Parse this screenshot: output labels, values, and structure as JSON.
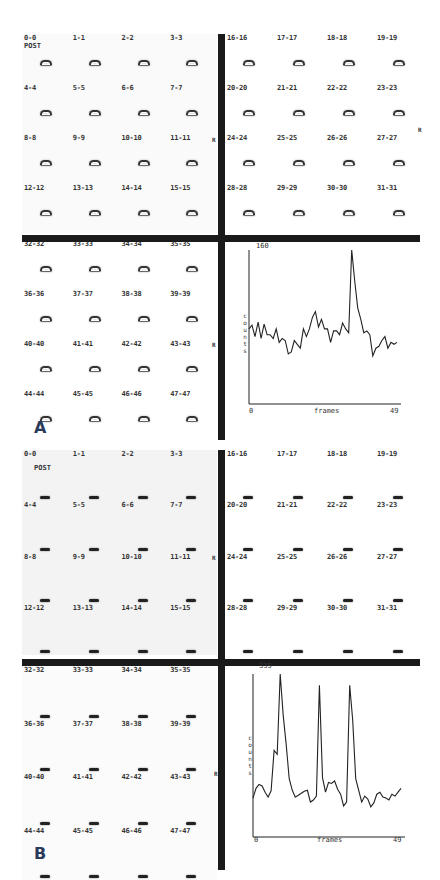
{
  "figure": {
    "panels": [
      {
        "id": "A",
        "letter": "A",
        "post_label": "POST",
        "quadrants": [
          {
            "labels": [
              "0-0",
              "1-1",
              "2-2",
              "3-3",
              "4-4",
              "5-5",
              "6-6",
              "7-7",
              "8-8",
              "9-9",
              "10-10",
              "11-11",
              "12-12",
              "13-13",
              "14-14",
              "15-15"
            ]
          },
          {
            "labels": [
              "16-16",
              "17-17",
              "18-18",
              "19-19",
              "20-20",
              "21-21",
              "22-22",
              "23-23",
              "24-24",
              "25-25",
              "26-26",
              "27-27",
              "28-28",
              "29-29",
              "30-30",
              "31-31"
            ]
          },
          {
            "labels": [
              "32-32",
              "33-33",
              "34-34",
              "35-35",
              "36-36",
              "37-37",
              "38-38",
              "39-39",
              "40-40",
              "41-41",
              "42-42",
              "43-43",
              "44-44",
              "45-45",
              "46-46",
              "47-47"
            ]
          }
        ],
        "markers": {
          "r1": "R",
          "l1": "L",
          "r2": "R",
          "r3": "R",
          "l2": "L",
          "l3": "L"
        }
      },
      {
        "id": "B",
        "letter": "B",
        "post_label": "POST",
        "quadrants": [
          {
            "labels": [
              "0-0",
              "1-1",
              "2-2",
              "3-3",
              "4-4",
              "5-5",
              "6-6",
              "7-7",
              "8-8",
              "9-9",
              "10-10",
              "11-11",
              "12-12",
              "13-13",
              "14-14",
              "15-15"
            ]
          },
          {
            "labels": [
              "16-16",
              "17-17",
              "18-18",
              "19-19",
              "20-20",
              "21-21",
              "22-22",
              "23-23",
              "24-24",
              "25-25",
              "26-26",
              "27-27",
              "28-28",
              "29-29",
              "30-30",
              "31-31"
            ]
          },
          {
            "labels": [
              "32-32",
              "33-33",
              "34-34",
              "35-35",
              "36-36",
              "37-37",
              "38-38",
              "39-39",
              "40-40",
              "41-41",
              "42-42",
              "43-43",
              "44-44",
              "45-45",
              "46-46",
              "47-47"
            ]
          }
        ],
        "markers": {
          "r1": "R",
          "l1": "L",
          "r2": "R",
          "r3": "R",
          "l2": "L",
          "l3": "L"
        }
      }
    ]
  },
  "chart_data": [
    {
      "type": "line",
      "panel": "A",
      "title": "",
      "xlabel": "frames",
      "ylabel": "counts",
      "y_top_label": "160",
      "x_tick_labels": [
        "0",
        "49"
      ],
      "xlim": [
        0,
        49
      ],
      "ylim": [
        0,
        160
      ],
      "grid": false,
      "values_note": "approximate, estimated from the plotted curve",
      "x": [
        0,
        1,
        2,
        3,
        4,
        5,
        6,
        7,
        8,
        9,
        10,
        11,
        12,
        13,
        14,
        15,
        16,
        17,
        18,
        19,
        20,
        21,
        22,
        23,
        24,
        25,
        26,
        27,
        28,
        29,
        30,
        31,
        32,
        33,
        34,
        35,
        36,
        37,
        38,
        39,
        40,
        41,
        42,
        43,
        44,
        45,
        46,
        47,
        48,
        49
      ],
      "values": [
        78,
        82,
        70,
        85,
        68,
        83,
        72,
        72,
        68,
        78,
        64,
        68,
        66,
        52,
        54,
        66,
        62,
        58,
        78,
        70,
        78,
        90,
        96,
        80,
        88,
        78,
        78,
        64,
        76,
        76,
        72,
        84,
        78,
        74,
        160,
        128,
        100,
        88,
        74,
        76,
        72,
        50,
        58,
        60,
        66,
        70,
        58,
        64,
        62,
        64
      ]
    },
    {
      "type": "line",
      "panel": "B",
      "title": "",
      "xlabel": "frames",
      "ylabel": "counts",
      "y_top_label": "335",
      "x_tick_labels": [
        "0",
        "49"
      ],
      "xlim": [
        0,
        49
      ],
      "ylim": [
        0,
        335
      ],
      "grid": false,
      "values_note": "approximate, estimated from the plotted curve",
      "x": [
        0,
        1,
        2,
        3,
        4,
        5,
        6,
        7,
        8,
        9,
        10,
        11,
        12,
        13,
        14,
        15,
        16,
        17,
        18,
        19,
        20,
        21,
        22,
        23,
        24,
        25,
        26,
        27,
        28,
        29,
        30,
        31,
        32,
        33,
        34,
        35,
        36,
        37,
        38,
        39,
        40,
        41,
        42,
        43,
        44,
        45,
        46,
        47,
        48,
        49
      ],
      "values": [
        80,
        100,
        108,
        105,
        92,
        82,
        95,
        178,
        170,
        335,
        250,
        190,
        120,
        96,
        82,
        86,
        90,
        94,
        96,
        72,
        76,
        84,
        312,
        122,
        92,
        112,
        110,
        115,
        98,
        88,
        64,
        72,
        312,
        240,
        120,
        96,
        72,
        84,
        78,
        62,
        70,
        88,
        92,
        82,
        80,
        76,
        88,
        84,
        92,
        100
      ]
    }
  ]
}
